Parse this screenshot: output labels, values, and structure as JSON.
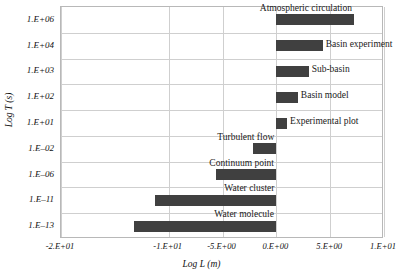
{
  "chart_data": {
    "type": "bar",
    "orientation": "horizontal",
    "title": "",
    "xlabel": "Log L (m)",
    "ylabel": "Log T (s)",
    "xlim": [
      -20,
      10
    ],
    "grid": true,
    "legend": "none",
    "bar_color": "#404040",
    "xticks": [
      -20,
      -10,
      -5,
      0,
      5,
      10
    ],
    "xtick_labels": [
      "-2.E+01",
      "-1.E+01",
      "-5.E+00",
      "0.E+00",
      "5.E+00",
      "1.E+01"
    ],
    "categories": [
      "1.E+06",
      "1.E+04",
      "1.E+03",
      "1.E+02",
      "1.E+01",
      "1.E-02",
      "1.E-06",
      "1.E-11",
      "1.E-13"
    ],
    "ytick_labels": [
      "1.E+06",
      "1.E+04",
      "1.E+03",
      "1.E+02",
      "1.E+01",
      "1.E–02",
      "1.E–06",
      "1.E–11",
      "1.E–13"
    ],
    "bars": [
      {
        "label": "Atmospheric circulation",
        "category": "1.E+06",
        "start": 0,
        "end": 7.2,
        "label_side": "above-left"
      },
      {
        "label": "Basin experiment",
        "category": "1.E+04",
        "start": 0,
        "end": 4.3,
        "label_side": "right"
      },
      {
        "label": "Sub-basin",
        "category": "1.E+03",
        "start": 0,
        "end": 3.0,
        "label_side": "right"
      },
      {
        "label": "Basin model",
        "category": "1.E+02",
        "start": 0,
        "end": 2.0,
        "label_side": "right"
      },
      {
        "label": "Experimental plot",
        "category": "1.E+01",
        "start": 0,
        "end": 1.0,
        "label_side": "right"
      },
      {
        "label": "Turbulent flow",
        "category": "1.E-02",
        "start": -2.2,
        "end": 0,
        "label_side": "above-left"
      },
      {
        "label": "Continuum point",
        "category": "1.E-06",
        "start": -5.6,
        "end": 0,
        "label_side": "above-left"
      },
      {
        "label": "Water cluster",
        "category": "1.E-11",
        "start": -11.3,
        "end": 0,
        "label_side": "above-left"
      },
      {
        "label": "Water molecule",
        "category": "1.E-13",
        "start": -13.2,
        "end": 0,
        "label_side": "above-left"
      }
    ]
  }
}
